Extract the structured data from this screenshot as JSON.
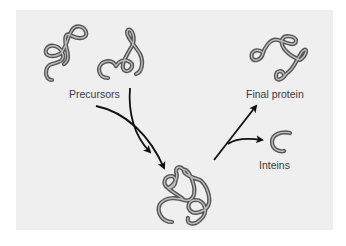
{
  "diagram": {
    "background_color": "#efefef",
    "tube_color": "#555555",
    "arrow_color": "#111111",
    "labels": {
      "precursors": "Precursors",
      "final_protein": "Final protein",
      "inteins": "Inteins"
    },
    "nodes": [
      {
        "id": "precursor-1",
        "label": "Precursors"
      },
      {
        "id": "precursor-2",
        "label": "Precursors"
      },
      {
        "id": "intermediate",
        "label": ""
      },
      {
        "id": "final-protein",
        "label": "Final protein"
      },
      {
        "id": "inteins",
        "label": "Inteins"
      }
    ],
    "edges": [
      {
        "from": "precursor-1",
        "to": "intermediate"
      },
      {
        "from": "precursor-2",
        "to": "intermediate"
      },
      {
        "from": "intermediate",
        "to": "final-protein"
      },
      {
        "from": "intermediate",
        "to": "inteins"
      }
    ]
  }
}
